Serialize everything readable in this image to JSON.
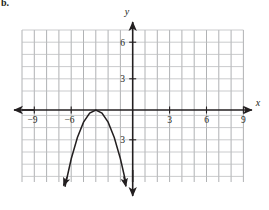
{
  "figure": {
    "corner_label": "b.",
    "background": "#ffffff",
    "ink_color": "#231f20",
    "grid_color": "#a7a9ac"
  },
  "axes": {
    "x_axis_label": "x",
    "y_axis_label": "y",
    "x_tick_labels": [
      "−9",
      "−6",
      "3",
      "6",
      "9"
    ],
    "x_tick_values": [
      -9,
      -6,
      3,
      6,
      9
    ],
    "y_tick_labels": [
      "6",
      "3",
      "3"
    ],
    "y_tick_values": [
      6,
      3,
      -3
    ],
    "x_range": [
      -9.5,
      9.5
    ],
    "y_range": [
      -6.5,
      7.0
    ],
    "grid_step": 1,
    "grid": true
  },
  "chart_data": {
    "type": "line",
    "title": "",
    "xlabel": "x",
    "ylabel": "y",
    "grid": true,
    "legend": null,
    "xlim": [
      -9.5,
      9.5
    ],
    "ylim": [
      -6.5,
      7.0
    ],
    "xticks": [
      -9,
      -6,
      3,
      6,
      9
    ],
    "yticks": [
      6,
      3,
      -3
    ],
    "series": [
      {
        "name": "parabola",
        "equation": "y = -(x + 3)^2",
        "vertex": [
          -3,
          0
        ],
        "opens": "down",
        "arrow_ends": [
          "left",
          "right"
        ],
        "x": [
          -5.5,
          -5.0,
          -4.5,
          -4.0,
          -3.5,
          -3.0,
          -2.5,
          -2.0,
          -1.5,
          -1.0,
          -0.6
        ],
        "values": [
          -6.25,
          -4.0,
          -2.25,
          -1.0,
          -0.25,
          0.0,
          -0.25,
          -1.0,
          -2.25,
          -4.0,
          -5.76
        ]
      }
    ]
  }
}
